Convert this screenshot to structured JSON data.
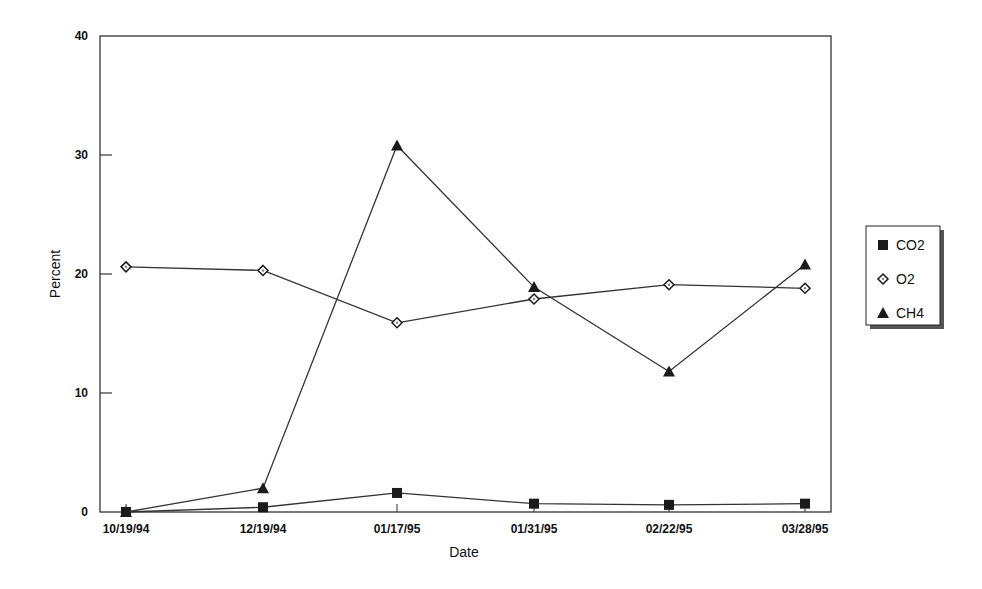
{
  "chart_data": {
    "type": "line",
    "title": "",
    "xlabel": "Date",
    "ylabel": "Percent",
    "ylim": [
      0,
      40
    ],
    "yticks": [
      0,
      10,
      20,
      30,
      40
    ],
    "grid": false,
    "legend_position": "right",
    "categories": [
      "10/19/94",
      "12/19/94",
      "01/17/95",
      "01/31/95",
      "02/22/95",
      "03/28/95"
    ],
    "series": [
      {
        "name": "CO2",
        "marker": "square",
        "values": [
          0.0,
          0.4,
          1.6,
          0.7,
          0.6,
          0.7
        ]
      },
      {
        "name": "O2",
        "marker": "diamond",
        "values": [
          20.6,
          20.3,
          15.9,
          17.9,
          19.1,
          18.8
        ]
      },
      {
        "name": "CH4",
        "marker": "triangle",
        "values": [
          0.0,
          2.0,
          30.8,
          18.9,
          11.8,
          20.8
        ]
      }
    ]
  },
  "colors": {
    "line": "#333333",
    "marker_fill": "#1a1a1a",
    "background": "#ffffff"
  }
}
